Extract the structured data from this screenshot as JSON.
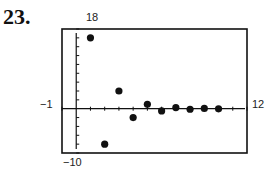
{
  "problem_number": "23.",
  "chart_data": {
    "type": "scatter",
    "title": "",
    "xlabel": "",
    "ylabel": "",
    "xlim": [
      -1,
      12
    ],
    "ylim": [
      -10,
      18
    ],
    "window_labels": {
      "xmin": "−1",
      "xmax": "12",
      "ymin": "−10",
      "ymax": "18"
    },
    "grid": false,
    "x_tick_step": 1,
    "y_tick_step": 2,
    "series": [
      {
        "name": "sequence",
        "x": [
          1,
          2,
          3,
          4,
          5,
          6,
          7,
          8,
          9,
          10
        ],
        "y": [
          16,
          -8,
          4,
          -2,
          1,
          -0.5,
          0.25,
          -0.125,
          0.0625,
          -0.03125
        ]
      }
    ]
  },
  "colors": {
    "ink": "#111111",
    "background": "#ffffff"
  }
}
